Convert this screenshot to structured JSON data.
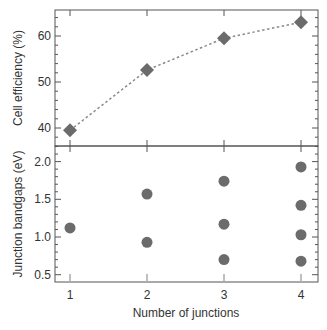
{
  "chart_data": [
    {
      "type": "line",
      "panel": "top",
      "title": "",
      "xlabel": "",
      "ylabel": "Cell efficiency (%)",
      "ylim": [
        35,
        66
      ],
      "yticks": [
        40,
        50,
        60
      ],
      "x": [
        1,
        2,
        3,
        4
      ],
      "series": [
        {
          "name": "Cell efficiency",
          "marker": "diamond",
          "linestyle": "dotted",
          "values": [
            39.5,
            52.6,
            59.5,
            63.0
          ]
        }
      ],
      "grid": false
    },
    {
      "type": "scatter",
      "panel": "bottom",
      "title": "",
      "xlabel": "Number of junctions",
      "ylabel": "Junction bandgaps (eV)",
      "ylim": [
        0.4,
        2.2
      ],
      "yticks": [
        0.5,
        1.0,
        1.5,
        2.0
      ],
      "xticks": [
        1,
        2,
        3,
        4
      ],
      "points": [
        {
          "x": 1,
          "y": 1.12
        },
        {
          "x": 2,
          "y": 1.57
        },
        {
          "x": 2,
          "y": 0.93
        },
        {
          "x": 3,
          "y": 1.74
        },
        {
          "x": 3,
          "y": 1.17
        },
        {
          "x": 3,
          "y": 0.7
        },
        {
          "x": 4,
          "y": 1.93
        },
        {
          "x": 4,
          "y": 1.42
        },
        {
          "x": 4,
          "y": 1.03
        },
        {
          "x": 4,
          "y": 0.68
        }
      ],
      "grid": false
    }
  ],
  "labels": {
    "top_ylabel": "Cell efficiency (%)",
    "bottom_ylabel": "Junction bandgaps (eV)",
    "xlabel": "Number of junctions",
    "top_ticks": [
      "40",
      "50",
      "60"
    ],
    "bottom_ticks": [
      "0.5",
      "1.0",
      "1.5",
      "2.0"
    ],
    "x_ticks": [
      "1",
      "2",
      "3",
      "4"
    ]
  },
  "colors": {
    "marker": "#6b6b6b",
    "axis": "#555555",
    "text": "#333333"
  }
}
